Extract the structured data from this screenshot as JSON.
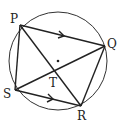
{
  "diagram": {
    "title": "",
    "circle": {
      "cx": 58,
      "cy": 61,
      "r": 49
    },
    "center_dot": {
      "x": 58,
      "y": 61
    },
    "points": {
      "P": {
        "label": "P",
        "x": 20,
        "y": 25
      },
      "Q": {
        "label": "Q",
        "x": 105,
        "y": 46
      },
      "R": {
        "label": "R",
        "x": 81,
        "y": 106
      },
      "S": {
        "label": "S",
        "x": 15,
        "y": 90
      },
      "T": {
        "label": "T",
        "x": 53,
        "y": 69
      }
    },
    "segments": [
      [
        "P",
        "Q"
      ],
      [
        "Q",
        "R"
      ],
      [
        "R",
        "S"
      ],
      [
        "S",
        "P"
      ],
      [
        "P",
        "R"
      ],
      [
        "S",
        "Q"
      ]
    ],
    "parallel_marks": [
      "PQ",
      "SR"
    ],
    "stroke_color": "#222222"
  }
}
